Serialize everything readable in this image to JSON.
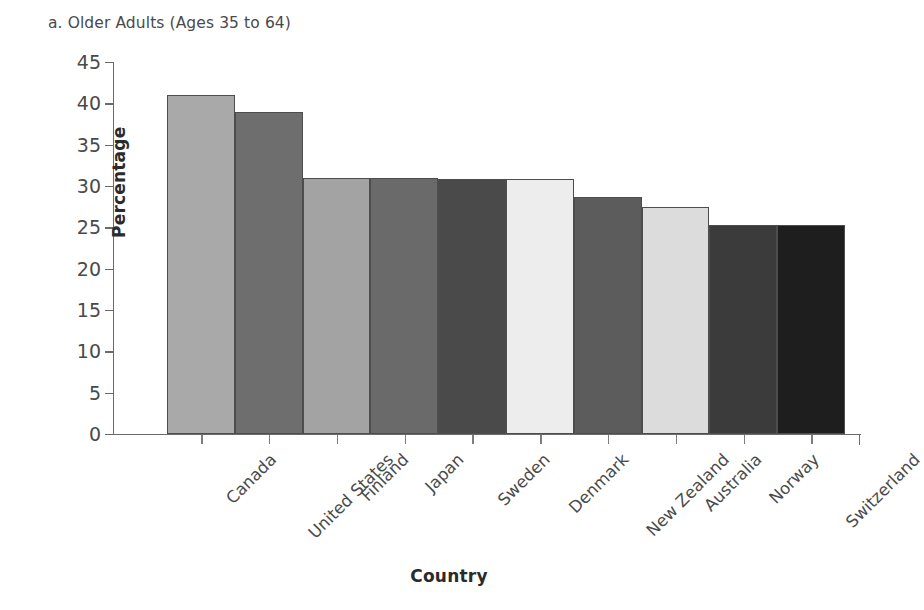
{
  "panel": {
    "title": "a. Older Adults (Ages 35 to 64)"
  },
  "chart_data": {
    "type": "bar",
    "title": "a. Older Adults (Ages 35 to 64)",
    "xlabel": "Country",
    "ylabel": "Percentage",
    "ylim": [
      0,
      45
    ],
    "yticks": [
      0,
      5,
      10,
      15,
      20,
      25,
      30,
      35,
      40,
      45
    ],
    "grid": false,
    "legend": "none",
    "categories": [
      "Canada",
      "United States",
      "Finland",
      "Japan",
      "Sweden",
      "Denmark",
      "New Zealand",
      "Australia",
      "Norway",
      "Switzerland"
    ],
    "values": [
      41.0,
      39.0,
      31.0,
      31.0,
      30.8,
      30.8,
      28.7,
      27.5,
      25.3,
      25.3
    ],
    "bar_colors": [
      "#a9a9a9",
      "#6e6e6e",
      "#a3a3a3",
      "#6a6a6a",
      "#4a4a4a",
      "#ededed",
      "#5c5c5c",
      "#dcdcdc",
      "#3b3b3b",
      "#1e1e1e"
    ],
    "bar_edge_color": "#4d4d4d",
    "axis_color": "#6b6b6b",
    "text_color": "#4a4a4a"
  }
}
